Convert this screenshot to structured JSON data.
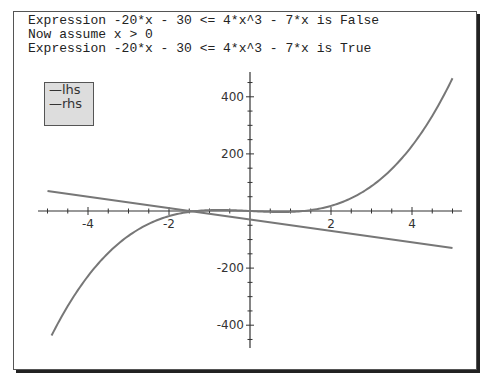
{
  "console": {
    "lines": [
      "Expression -20*x - 30 <= 4*x^3 - 7*x is False",
      "Now assume x > 0",
      "Expression -20*x - 30 <= 4*x^3 - 7*x is True"
    ]
  },
  "legend": {
    "items": [
      "—lhs",
      "—rhs"
    ]
  },
  "chart_data": {
    "type": "line",
    "title": "",
    "xlabel": "",
    "ylabel": "",
    "xlim": [
      -5,
      5
    ],
    "ylim": [
      -480,
      480
    ],
    "x_ticks": [
      "-4",
      "-2",
      "2",
      "4"
    ],
    "y_ticks": [
      "400",
      "200",
      "-200",
      "-400"
    ],
    "grid": false,
    "legend_position": "upper-left",
    "series": [
      {
        "name": "lhs",
        "expression": "-20*x - 30",
        "x": [
          -5,
          0,
          5
        ],
        "values": [
          70,
          -30,
          -130
        ]
      },
      {
        "name": "rhs",
        "expression": "4*x^3 - 7*x",
        "x": [
          -4.9,
          -4,
          -3,
          -2,
          -1,
          0,
          1,
          2,
          3,
          4,
          5
        ],
        "values": [
          -436,
          -228,
          -87,
          -18,
          3,
          0,
          -3,
          18,
          87,
          228,
          465
        ]
      }
    ],
    "colors": {
      "curve": "#777777",
      "axis": "#333333"
    }
  }
}
